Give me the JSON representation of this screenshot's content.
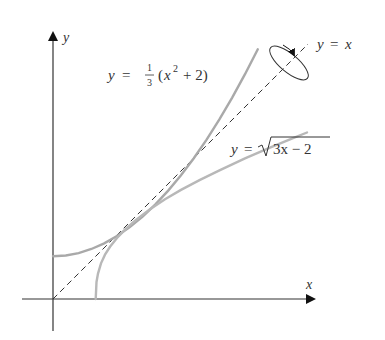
{
  "figure": {
    "axes": {
      "x_label": "x",
      "y_label": "y",
      "axis_color": "#333333"
    },
    "curves": [
      {
        "name": "parabola",
        "label_lhs": "y =",
        "label_frac_num": "1",
        "label_frac_den": "3",
        "label_rhs_open": "(x",
        "label_rhs_exp": "2",
        "label_rhs_close": "+ 2)",
        "color": "#a9a9a9"
      },
      {
        "name": "sqrt",
        "label_lhs": "y =",
        "label_radicand": "3x − 2",
        "color": "#b8b8b8"
      },
      {
        "name": "line",
        "label": "y = x",
        "style": "dashed",
        "color": "#333333"
      }
    ],
    "rotation_indicator": "ellipse-arrow-around-y=x"
  }
}
